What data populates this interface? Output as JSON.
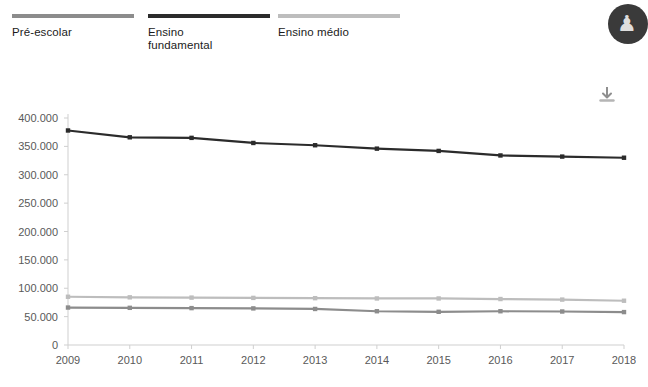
{
  "legend": {
    "items": [
      {
        "label": "Pré-escolar",
        "color": "#8c8c8c"
      },
      {
        "label": "Ensino\nfundamental",
        "color": "#2b2b2b"
      },
      {
        "label": "Ensino médio",
        "color": "#bdbdbd"
      }
    ]
  },
  "toolbar": {
    "download_icon": "download-icon",
    "download_title": "Download"
  },
  "avatar": {
    "icon": "user-avatar-icon",
    "glyph": "♟"
  },
  "chart_data": {
    "type": "line",
    "title": "",
    "xlabel": "",
    "ylabel": "",
    "x": [
      2009,
      2010,
      2011,
      2012,
      2013,
      2014,
      2015,
      2016,
      2017,
      2018
    ],
    "xtick_labels": [
      "2009",
      "2010",
      "2011",
      "2012",
      "2013",
      "2014",
      "2015",
      "2016",
      "2017",
      "2018"
    ],
    "ylim": [
      0,
      400000
    ],
    "yticks": [
      0,
      50000,
      100000,
      150000,
      200000,
      250000,
      300000,
      350000,
      400000
    ],
    "ytick_labels": [
      "0",
      "50.000",
      "100.000",
      "150.000",
      "200.000",
      "250.000",
      "300.000",
      "350.000",
      "400.000"
    ],
    "grid": false,
    "legend_position": "top",
    "markers": "square",
    "series": [
      {
        "name": "Pré-escolar",
        "color": "#8c8c8c",
        "values": [
          66000,
          65500,
          65000,
          64500,
          63500,
          59500,
          58500,
          59500,
          59000,
          58000
        ]
      },
      {
        "name": "Ensino fundamental",
        "color": "#2b2b2b",
        "values": [
          378000,
          366000,
          365000,
          356000,
          352000,
          346000,
          342000,
          334000,
          332000,
          330000
        ]
      },
      {
        "name": "Ensino médio",
        "color": "#bdbdbd",
        "values": [
          85000,
          84000,
          83500,
          83000,
          82500,
          82000,
          82000,
          81000,
          80000,
          78000
        ]
      }
    ]
  }
}
